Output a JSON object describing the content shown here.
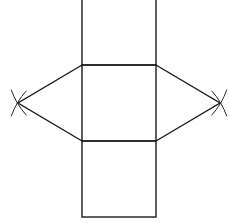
{
  "figure": {
    "width": 231,
    "height": 223,
    "stroke_color": "#1a1a1a",
    "background": "#ffffff"
  },
  "rectangles": [
    {
      "name": "top-face",
      "x": 82,
      "y": -2,
      "w": 74,
      "h": 67
    },
    {
      "name": "middle-face",
      "x": 82,
      "y": 65,
      "w": 74,
      "h": 76
    },
    {
      "name": "bottom-face",
      "x": 82,
      "y": 141,
      "w": 74,
      "h": 76
    }
  ],
  "triangles": [
    {
      "name": "left-triangle",
      "points": [
        [
          82,
          65
        ],
        [
          18,
          103
        ],
        [
          82,
          141
        ]
      ]
    },
    {
      "name": "right-triangle",
      "points": [
        [
          156,
          65
        ],
        [
          220,
          103
        ],
        [
          156,
          141
        ]
      ]
    }
  ],
  "construction_arcs": [
    {
      "name": "left-arc-upper",
      "cx": 82,
      "cy": 65,
      "r": 75,
      "near": [
        18,
        103
      ]
    },
    {
      "name": "left-arc-lower",
      "cx": 82,
      "cy": 141,
      "r": 75,
      "near": [
        18,
        103
      ]
    },
    {
      "name": "right-arc-upper",
      "cx": 156,
      "cy": 65,
      "r": 75,
      "near": [
        220,
        103
      ]
    },
    {
      "name": "right-arc-lower",
      "cx": 156,
      "cy": 141,
      "r": 75,
      "near": [
        220,
        103
      ]
    }
  ]
}
